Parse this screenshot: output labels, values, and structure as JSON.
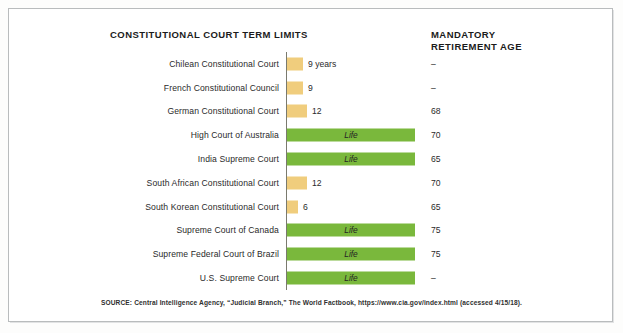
{
  "chart_title": "CONSTITUTIONAL COURT TERM LIMITS",
  "column_title_line1": "MANDATORY",
  "column_title_line2": "RETIREMENT AGE",
  "source": "SOURCE: Central Intelligence Agency, “Judicial Branch,” The World Factbook, https://www.cia.gov/index.html (accessed 4/15/18).",
  "colors": {
    "tan_bar": "#f0cd7d",
    "green_bar": "#7ab83c",
    "axis": "#7a7a6e",
    "frame": "#b9bcbd",
    "text": "#2a2a2a"
  },
  "chart_data": {
    "type": "bar",
    "title": "CONSTITUTIONAL COURT TERM LIMITS",
    "xlabel": "",
    "ylabel": "",
    "orientation": "horizontal",
    "grid": false,
    "legend": "none",
    "xlim": [
      0,
      14
    ],
    "categories": [
      "Chilean Constitutional Court",
      "French Constitutional Council",
      "German Constitutional Court",
      "High Court of Australia",
      "India Supreme Court",
      "South African Constitutional Court",
      "South Korean Constitutional Court",
      "Supreme Court of Canada",
      "Supreme  Federal Court of Brazil",
      "U.S. Supreme Court"
    ],
    "values": [
      9,
      9,
      12,
      "Life",
      "Life",
      12,
      6,
      "Life",
      "Life",
      "Life"
    ],
    "value_labels": [
      "9 years",
      "9",
      "12",
      "Life",
      "Life",
      "12",
      "6",
      "Life",
      "Life",
      "Life"
    ],
    "mandatory_retirement_age": [
      "–",
      "–",
      "68",
      "70",
      "65",
      "70",
      "65",
      "75",
      "75",
      "–"
    ],
    "series": [
      {
        "name": "Term limit (years)",
        "values": [
          9,
          9,
          12,
          null,
          null,
          12,
          6,
          null,
          null,
          null
        ]
      },
      {
        "name": "Life tenure",
        "values": [
          null,
          null,
          null,
          "Life",
          "Life",
          null,
          null,
          "Life",
          "Life",
          "Life"
        ]
      }
    ]
  },
  "rows": [
    {
      "label": "Chilean Constitutional Court",
      "value_label": "9 years",
      "bar_type": "tan",
      "bar_px": 16,
      "retirement": "–"
    },
    {
      "label": "French Constitutional Council",
      "value_label": "9",
      "bar_type": "tan",
      "bar_px": 16,
      "retirement": "–"
    },
    {
      "label": "German Constitutional Court",
      "value_label": "12",
      "bar_type": "tan",
      "bar_px": 20,
      "retirement": "68"
    },
    {
      "label": "High Court of Australia",
      "value_label": "Life",
      "bar_type": "green",
      "bar_px": 128,
      "retirement": "70"
    },
    {
      "label": "India Supreme Court",
      "value_label": "Life",
      "bar_type": "green",
      "bar_px": 128,
      "retirement": "65"
    },
    {
      "label": "South African Constitutional Court",
      "value_label": "12",
      "bar_type": "tan",
      "bar_px": 20,
      "retirement": "70"
    },
    {
      "label": "South Korean Constitutional Court",
      "value_label": "6",
      "bar_type": "tan",
      "bar_px": 11,
      "retirement": "65"
    },
    {
      "label": "Supreme Court of Canada",
      "value_label": "Life",
      "bar_type": "green",
      "bar_px": 128,
      "retirement": "75"
    },
    {
      "label": "Supreme  Federal Court of Brazil",
      "value_label": "Life",
      "bar_type": "green",
      "bar_px": 128,
      "retirement": "75"
    },
    {
      "label": "U.S. Supreme Court",
      "value_label": "Life",
      "bar_type": "green",
      "bar_px": 128,
      "retirement": "–"
    }
  ]
}
